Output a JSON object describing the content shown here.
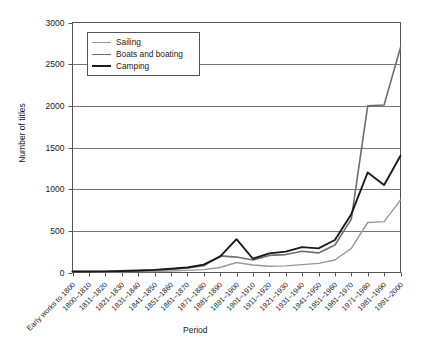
{
  "chart_data": {
    "type": "line",
    "title": "",
    "xlabel": "Period",
    "ylabel": "Number of titles",
    "ylim": [
      0,
      3000
    ],
    "yticks": [
      0,
      500,
      1000,
      1500,
      2000,
      2500,
      3000
    ],
    "grid": "horizontal",
    "legend_position": "upper-left-inside",
    "categories": [
      "Early works to 1800",
      "1800–1810",
      "1811–1820",
      "1821–1830",
      "1831–1840",
      "1841–1850",
      "1851–1860",
      "1861–1870",
      "1871–1880",
      "1881–1890",
      "1891–1900",
      "1901–1910",
      "1911–1920",
      "1921–1930",
      "1931–1940",
      "1941–1950",
      "1951–1960",
      "1961–1970",
      "1971–1980",
      "1981–1990",
      "1991–2000"
    ],
    "series": [
      {
        "name": "Sailing",
        "color": "#999999",
        "width": 1.4,
        "values": [
          5,
          5,
          5,
          8,
          10,
          12,
          18,
          25,
          35,
          60,
          120,
          90,
          75,
          80,
          95,
          110,
          150,
          290,
          600,
          610,
          870
        ]
      },
      {
        "name": "Boats and boating",
        "color": "#6e6e6e",
        "width": 1.6,
        "values": [
          10,
          10,
          12,
          15,
          20,
          28,
          40,
          55,
          80,
          200,
          185,
          150,
          205,
          215,
          255,
          235,
          330,
          640,
          2000,
          2010,
          2700
        ]
      },
      {
        "name": "Camping",
        "color": "#1a1a1a",
        "width": 1.9,
        "values": [
          12,
          12,
          14,
          18,
          24,
          32,
          45,
          60,
          95,
          190,
          400,
          165,
          230,
          250,
          305,
          290,
          390,
          700,
          1200,
          1050,
          1400
        ]
      }
    ]
  },
  "legend": {
    "items": [
      {
        "label": "Sailing"
      },
      {
        "label": "Boats and boating"
      },
      {
        "label": "Camping"
      }
    ]
  }
}
